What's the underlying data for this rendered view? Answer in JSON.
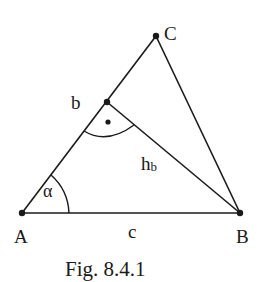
{
  "figure": {
    "caption": "Fig. 8.4.1",
    "stroke_color": "#1a1a1a",
    "background": "#ffffff"
  },
  "points": {
    "A": {
      "label": "A",
      "x": 22,
      "y": 213
    },
    "B": {
      "label": "B",
      "x": 240,
      "y": 213
    },
    "C": {
      "label": "C",
      "x": 156,
      "y": 36
    },
    "H": {
      "label": "",
      "x": 107,
      "y": 102
    }
  },
  "labels": {
    "side_b": "b",
    "side_c": "c",
    "altitude_main": "h",
    "altitude_sub": "b",
    "angle_alpha": "α"
  },
  "annotations": {
    "right_angle_marker": "right-angle at foot of altitude",
    "angle_alpha_marker": "arc at vertex A"
  }
}
